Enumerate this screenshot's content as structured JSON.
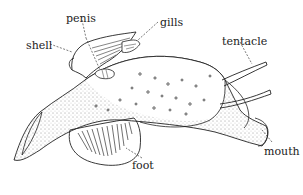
{
  "diagram": {
    "type": "anatomical illustration",
    "stroke_color": "#222222",
    "background": "#ffffff",
    "labels": [
      {
        "id": "penis",
        "text": "penis",
        "x": 66,
        "y": 13
      },
      {
        "id": "gills",
        "text": "gills",
        "x": 160,
        "y": 17
      },
      {
        "id": "shell",
        "text": "shell",
        "x": 26,
        "y": 40
      },
      {
        "id": "tentacle",
        "text": "tentacle",
        "x": 222,
        "y": 36
      },
      {
        "id": "foot",
        "text": "foot",
        "x": 132,
        "y": 160
      },
      {
        "id": "mouth",
        "text": "mouth",
        "x": 264,
        "y": 146
      }
    ]
  }
}
